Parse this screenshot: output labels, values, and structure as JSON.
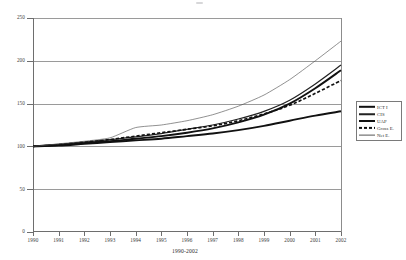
{
  "chart_data": {
    "type": "line",
    "title": "",
    "subtitle": "",
    "xlabel": "1990-2002",
    "ylabel": "",
    "xlim": [
      1990,
      2002
    ],
    "ylim": [
      0,
      250
    ],
    "grid": true,
    "legend_position": "right",
    "note": "Index series, all normalised to 100 in 1990",
    "x": [
      1990,
      1991,
      1992,
      1993,
      1994,
      1995,
      1996,
      1997,
      1998,
      1999,
      2000,
      2001,
      2002
    ],
    "xtick_labels": [
      "1990",
      "1991",
      "1992",
      "1993",
      "1994",
      "1995",
      "1996",
      "1997",
      "1998",
      "1999",
      "2000",
      "2001",
      "2002"
    ],
    "ytick_labels": [
      "0",
      "50",
      "100",
      "150",
      "200",
      "250"
    ],
    "ytick_values": [
      0,
      50,
      100,
      150,
      200,
      250
    ],
    "series": [
      {
        "name": "ICT I",
        "style": "solid-thick",
        "color": "#111111",
        "values": [
          100,
          102,
          104,
          106,
          109,
          112,
          116,
          121,
          128,
          137,
          150,
          168,
          189
        ]
      },
      {
        "name": "CIS",
        "style": "solid-medium",
        "color": "#222222",
        "values": [
          100,
          102,
          105,
          108,
          111,
          115,
          120,
          125,
          132,
          141,
          154,
          173,
          195
        ]
      },
      {
        "name": "UAP",
        "style": "solid-thick",
        "color": "#111111",
        "values": [
          100,
          101,
          103,
          105,
          107,
          109,
          112,
          115,
          119,
          124,
          130,
          136,
          141
        ]
      },
      {
        "name": "Gross E.",
        "style": "dashed-thick",
        "color": "#111111",
        "values": [
          100,
          102,
          105,
          108,
          112,
          116,
          120,
          124,
          130,
          138,
          148,
          162,
          177
        ]
      },
      {
        "name": "Net E.",
        "style": "solid-thin",
        "color": "#555555",
        "values": [
          100,
          103,
          106,
          110,
          122,
          125,
          130,
          137,
          147,
          160,
          178,
          200,
          223
        ]
      }
    ]
  },
  "legend": {
    "items": [
      {
        "label": "ICT I",
        "swatch": "sw-ict"
      },
      {
        "label": "CIS",
        "swatch": "sw-cis"
      },
      {
        "label": "UAP",
        "swatch": "sw-uap"
      },
      {
        "label": "Gross E.",
        "swatch": "sw-gross"
      },
      {
        "label": "Net E.",
        "swatch": "sw-net"
      }
    ]
  }
}
